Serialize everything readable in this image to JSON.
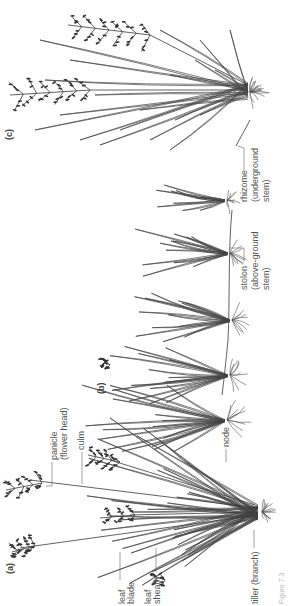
{
  "figure": {
    "orientation": "rotated-90-ccw",
    "panels": [
      {
        "id": "a",
        "label": "(a)",
        "description": "tufted grass plant",
        "annotations": [
          "panicle",
          "(flower head)",
          "culm",
          "node",
          "leaf",
          "blade",
          "leaf",
          "sheath",
          "tiller (branch)"
        ]
      },
      {
        "id": "b",
        "label": "(b)",
        "description": "stoloniferous grass",
        "annotations": [
          "stolon",
          "(above-ground",
          "stem)"
        ]
      },
      {
        "id": "c",
        "label": "(c)",
        "description": "rhizomatous grass",
        "annotations": [
          "rhizome",
          "(underground",
          "stem)"
        ]
      }
    ],
    "caption": "Figure 7.3"
  }
}
